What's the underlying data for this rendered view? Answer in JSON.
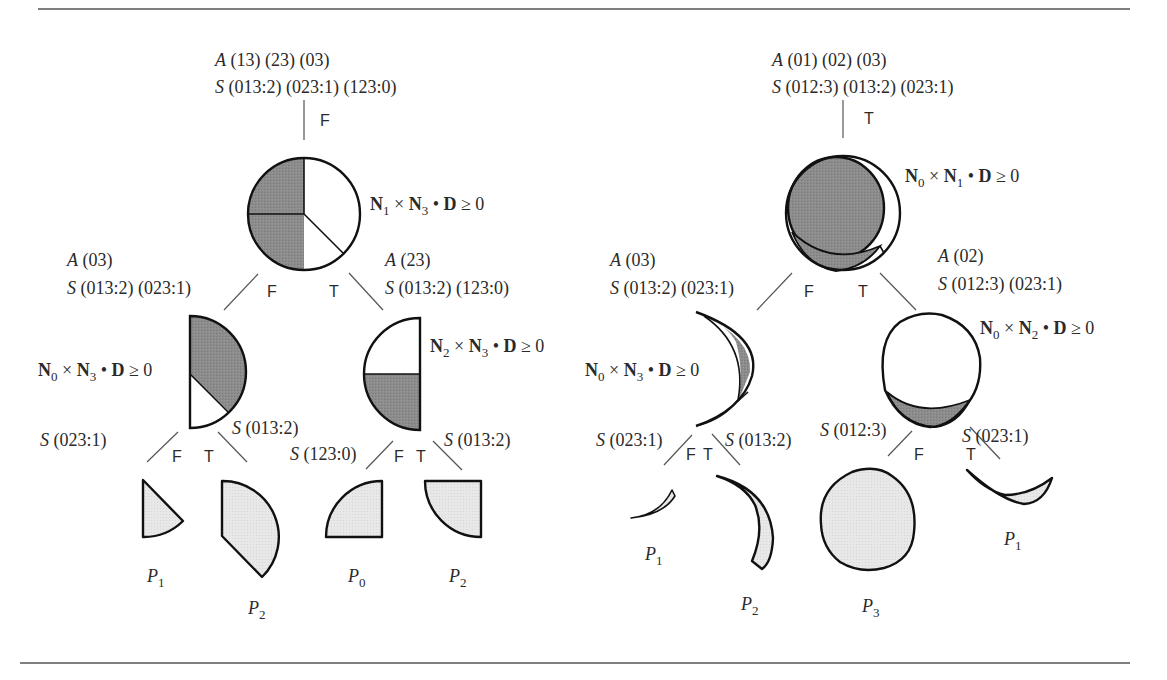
{
  "figure": {
    "left_tree": {
      "root": {
        "A_label": "A",
        "A_sets": " (13) (23) (03)",
        "S_label": "S",
        "S_sets": " (013:2) (023:1) (123:0)",
        "branch": "F"
      },
      "node1": {
        "test": {
          "N_a": "N",
          "a": "1",
          "times": " × ",
          "N_b": "N",
          "b": "3",
          "dot": " • ",
          "D": "D",
          "rel": " ≥ 0"
        },
        "fill_regions": [
          "shaded upper-left",
          "shaded lower-left",
          "white right",
          "white lower-right"
        ]
      },
      "left_branch_info": {
        "A_label": "A",
        "A_sets": " (03)",
        "S_label": "S",
        "S_sets": " (013:2) (023:1)",
        "branch": "F"
      },
      "right_branch_info": {
        "A_label": "A",
        "A_sets": " (23)",
        "S_label": "S",
        "S_sets": " (013:2) (123:0)",
        "branch": "T"
      },
      "node2_left": {
        "test": {
          "N_a": "N",
          "a": "0",
          "times": " × ",
          "N_b": "N",
          "b": "3",
          "dot": " • ",
          "D": "D",
          "rel": " ≥ 0"
        },
        "left_edge": {
          "S_label": "S",
          "S_sets": " (023:1)",
          "branch": "F"
        },
        "right_edge": {
          "S_label": "S",
          "S_sets": " (013:2)",
          "branch": "T"
        }
      },
      "node2_right": {
        "test": {
          "N_a": "N",
          "a": "2",
          "times": " × ",
          "N_b": "N",
          "b": "3",
          "dot": " • ",
          "D": "D",
          "rel": " ≥ 0"
        },
        "left_edge": {
          "S_label": "S",
          "S_sets": " (123:0)",
          "branch": "F"
        },
        "right_edge": {
          "S_label": "S",
          "S_sets": " (013:2)",
          "branch": "T"
        }
      },
      "leaves": [
        {
          "P": "P",
          "sub": "1"
        },
        {
          "P": "P",
          "sub": "2"
        },
        {
          "P": "P",
          "sub": "0"
        },
        {
          "P": "P",
          "sub": "2"
        }
      ]
    },
    "right_tree": {
      "root": {
        "A_label": "A",
        "A_sets": " (01) (02) (03)",
        "S_label": "S",
        "S_sets": " (012:3) (013:2) (023:1)",
        "branch": "T"
      },
      "node1": {
        "test": {
          "N_a": "N",
          "a": "0",
          "times": " × ",
          "N_b": "N",
          "b": "1",
          "dot": " • ",
          "D": "D",
          "rel": " ≥ 0"
        }
      },
      "left_branch_info": {
        "A_label": "A",
        "A_sets": " (03)",
        "S_label": "S",
        "S_sets": " (013:2) (023:1)",
        "branch": "F"
      },
      "right_branch_info": {
        "A_label": "A",
        "A_sets": " (02)",
        "S_label": "S",
        "S_sets": " (012:3) (023:1)",
        "branch": "T"
      },
      "node2_left": {
        "test": {
          "N_a": "N",
          "a": "0",
          "times": " × ",
          "N_b": "N",
          "b": "3",
          "dot": " • ",
          "D": "D",
          "rel": " ≥ 0"
        },
        "left_edge": {
          "S_label": "S",
          "S_sets": " (023:1)",
          "branch": "F"
        },
        "right_edge": {
          "S_label": "S",
          "S_sets": " (013:2)",
          "branch": "T"
        }
      },
      "node2_right": {
        "test": {
          "N_a": "N",
          "a": "0",
          "times": " × ",
          "N_b": "N",
          "b": "2",
          "dot": " • ",
          "D": "D",
          "rel": " ≥ 0"
        },
        "left_edge": {
          "S_label": "S",
          "S_sets": " (012:3)",
          "branch": "F"
        },
        "right_edge": {
          "S_label": "S",
          "S_sets": " (023:1)",
          "branch": "T"
        }
      },
      "leaves": [
        {
          "P": "P",
          "sub": "1"
        },
        {
          "P": "P",
          "sub": "2"
        },
        {
          "P": "P",
          "sub": "3"
        },
        {
          "P": "P",
          "sub": "1"
        }
      ]
    },
    "colors": {
      "dark_shade": "#8a8a8a",
      "light_shade": "#e6e6e6",
      "outline": "#111111",
      "text": "#2a2a2a",
      "rule": "#555555"
    }
  }
}
